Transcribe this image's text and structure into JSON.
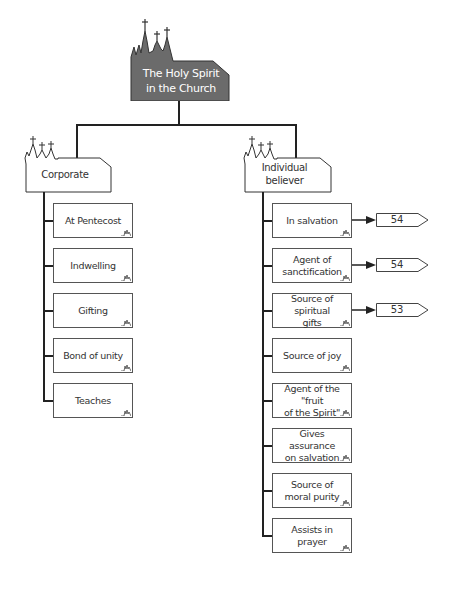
{
  "diagram": {
    "title": "The Holy Spirit in the Church",
    "title_lines": [
      "The Holy Spirit",
      "in the Church"
    ],
    "colors": {
      "title_fill": "#6b6b6b",
      "title_text": "#ffffff",
      "line": "#222222",
      "box_border": "#555555"
    },
    "branches": [
      {
        "label": "Corporate",
        "items": [
          {
            "label": "At Pentecost"
          },
          {
            "label": "Indwelling"
          },
          {
            "label": "Gifting"
          },
          {
            "label": "Bond of unity"
          },
          {
            "label": "Teaches"
          }
        ]
      },
      {
        "label": "Individual believer",
        "label_lines": [
          "Individual",
          "believer"
        ],
        "items": [
          {
            "label": "In salvation",
            "ref": "54"
          },
          {
            "label": "Agent of sanctification",
            "lines": [
              "Agent of",
              "sanctification"
            ],
            "ref": "54"
          },
          {
            "label": "Source of spiritual gifts",
            "lines": [
              "Source of spiritual",
              "gifts"
            ],
            "ref": "53"
          },
          {
            "label": "Source of joy"
          },
          {
            "label": "Agent of the \"fruit of the Spirit\"",
            "lines": [
              "Agent of the \"fruit",
              "of the Spirit\""
            ]
          },
          {
            "label": "Gives assurance on salvation",
            "lines": [
              "Gives assurance",
              "on salvation"
            ]
          },
          {
            "label": "Source of moral purity",
            "lines": [
              "Source of",
              "moral purity"
            ]
          },
          {
            "label": "Assists in prayer"
          }
        ]
      }
    ]
  },
  "icons": {
    "church": "church-silhouette-icon",
    "squiggle": "church-mini-icon",
    "arrow": "arrow-right-icon",
    "page_tag": "page-reference-tag"
  }
}
